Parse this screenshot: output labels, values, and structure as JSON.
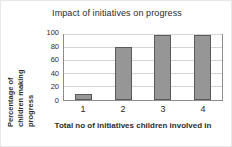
{
  "chart_data": {
    "type": "bar",
    "title": "Impact of initiatives on progress",
    "xlabel": "Total no of initiatives children involved in",
    "ylabel": "Percentage of children making progress",
    "ylabel_lines": [
      "Percentage of",
      "children making",
      "progress"
    ],
    "categories": [
      "1",
      "2",
      "3",
      "4"
    ],
    "values": [
      10,
      82,
      100,
      100
    ],
    "ylim": [
      0,
      100
    ],
    "yticks": [
      0,
      20,
      40,
      60,
      80,
      100
    ],
    "ytick_labels": [
      "0",
      "20",
      "40",
      "60",
      "80",
      "100"
    ],
    "grid": true,
    "grid_axis": "y",
    "legend": false,
    "bar_color": "#969696",
    "bar_border_color": "#5a5a5a",
    "plot_border_color": "#8c8c8c",
    "grid_color": "#d4d4d4",
    "text_color": "#2b2b2b",
    "background": "#ffffff"
  }
}
